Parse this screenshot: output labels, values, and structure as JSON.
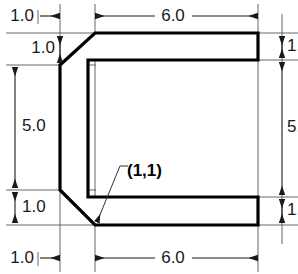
{
  "drawing": {
    "title": "C-channel profile with chamfered corners",
    "units_implied": "inches",
    "colors": {
      "profile_stroke": "#000000",
      "profile_fill": "#ffffff",
      "dimension_line": "#1a1a1a",
      "extension_line": "#555555",
      "text": "#1a1a1a",
      "background": "#ffffff"
    },
    "coordinate_label": {
      "name": "origin-point-label",
      "text": "(1,1)",
      "points_to": "lower chamfer vertex"
    },
    "dimensions": [
      {
        "id": "top-left-horizontal",
        "label": "1.0",
        "orientation": "horizontal"
      },
      {
        "id": "top-left-vertical",
        "label": "1.0",
        "orientation": "vertical"
      },
      {
        "id": "top-horizontal",
        "label": "6.0",
        "orientation": "horizontal"
      },
      {
        "id": "top-right-vertical",
        "label": "1.0",
        "orientation": "vertical"
      },
      {
        "id": "left-vertical",
        "label": "5.0",
        "orientation": "vertical"
      },
      {
        "id": "right-vertical",
        "label": "5.0",
        "orientation": "vertical"
      },
      {
        "id": "bottom-left-vertical",
        "label": "1.0",
        "orientation": "vertical"
      },
      {
        "id": "bottom-right-vertical",
        "label": "1.0",
        "orientation": "vertical"
      },
      {
        "id": "bottom-left-horizontal",
        "label": "1.0",
        "orientation": "horizontal"
      },
      {
        "id": "bottom-horizontal",
        "label": "6.0",
        "orientation": "horizontal"
      }
    ]
  }
}
